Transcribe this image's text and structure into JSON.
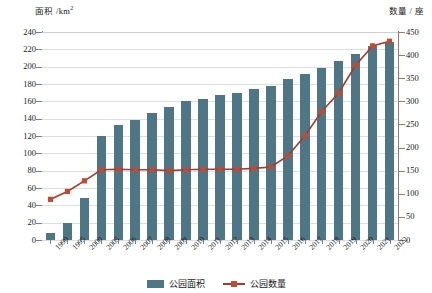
{
  "chart_data": {
    "type": "bar",
    "title": "",
    "categories": [
      "1990",
      "1995",
      "2000",
      "2005",
      "2006",
      "2007",
      "2008",
      "2009",
      "2010",
      "2011",
      "2012",
      "2013",
      "2014",
      "2015",
      "2016",
      "2017",
      "2018",
      "2019",
      "2020",
      "2021",
      "2022"
    ],
    "series": [
      {
        "name": "公园面积",
        "type": "bar",
        "axis": "left",
        "color": "#4f7687",
        "values": [
          8,
          20,
          48,
          120,
          133,
          139,
          147,
          153,
          160,
          163,
          167,
          170,
          174,
          178,
          186,
          191,
          198,
          207,
          215,
          224,
          228
        ]
      },
      {
        "name": "公园数量",
        "type": "line",
        "axis": "right",
        "color": "#a33c2a",
        "marker_color": "#bf4b32",
        "values": [
          88,
          105,
          128,
          152,
          153,
          152,
          152,
          150,
          152,
          153,
          153,
          153,
          155,
          158,
          182,
          225,
          278,
          318,
          378,
          420,
          430
        ]
      }
    ],
    "xlabel": "",
    "ylabel_left": "面积 /km",
    "ylabel_left_sup": "2",
    "ylabel_right": "数量 / 座",
    "ylim_left": [
      0,
      240
    ],
    "ytick_left": [
      0,
      20,
      40,
      60,
      80,
      100,
      120,
      140,
      160,
      180,
      200,
      220,
      240
    ],
    "ylim_right": [
      0,
      450
    ],
    "ytick_right": [
      0,
      50,
      100,
      150,
      200,
      250,
      300,
      350,
      400,
      450
    ],
    "grid": true,
    "legend_position": "bottom"
  },
  "legend": {
    "bar_label": "公园面积",
    "line_label": "公园数量"
  }
}
